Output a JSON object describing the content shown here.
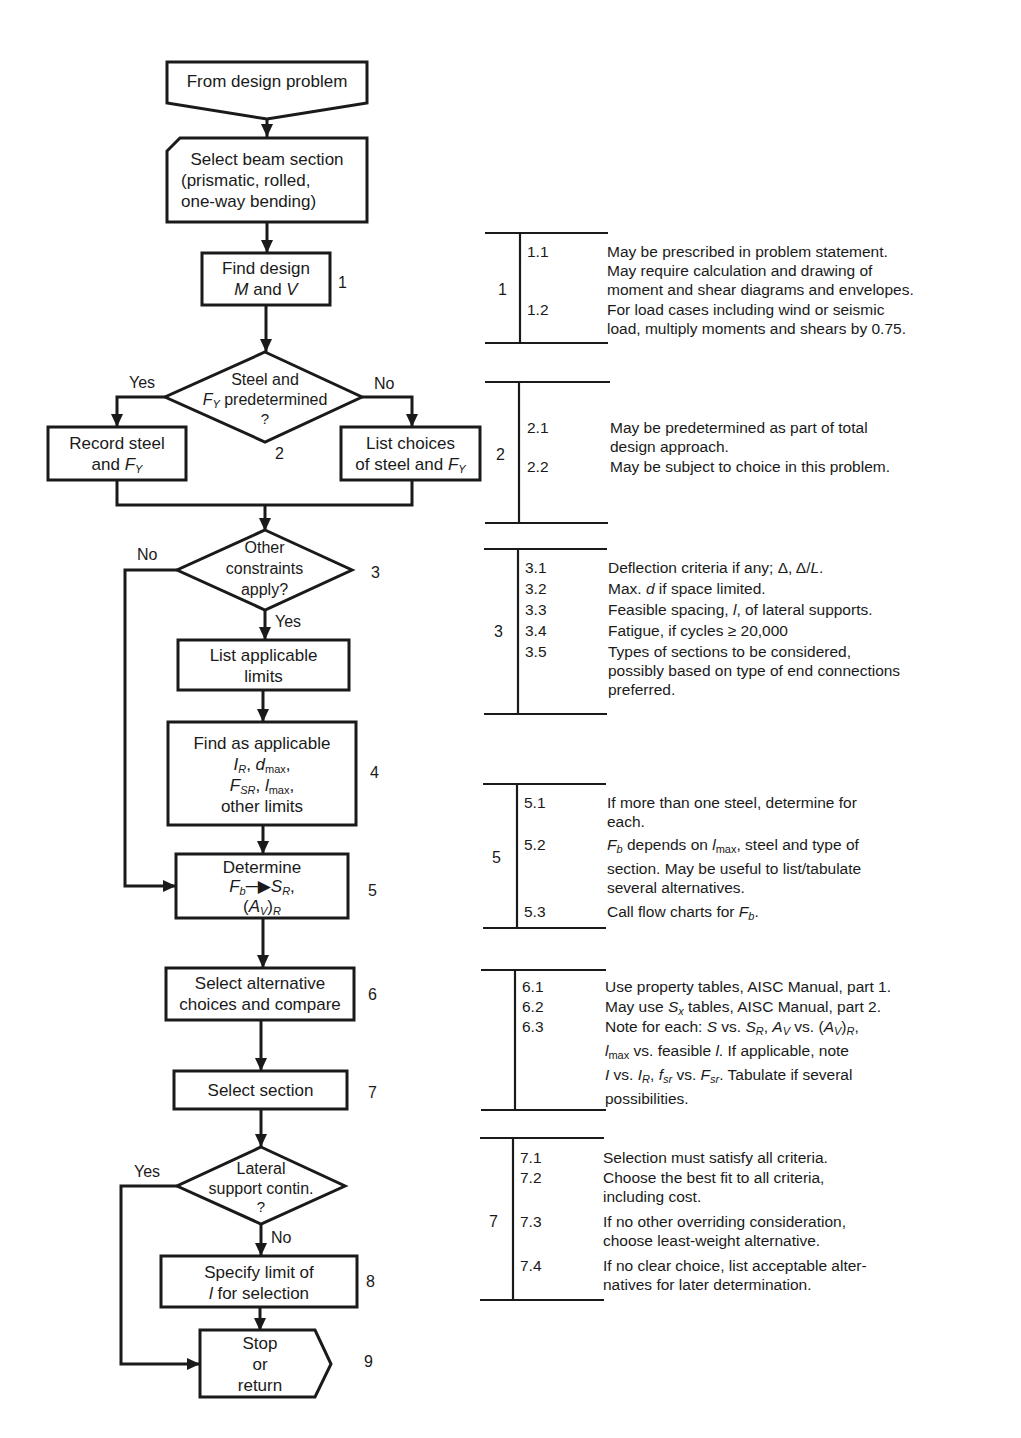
{
  "flowchart": {
    "start": {
      "label": "From design problem"
    },
    "select_beam": {
      "lines": [
        "Select beam section",
        "(prismatic, rolled,",
        "one-way bending)"
      ]
    },
    "find_design": {
      "lines": [
        "Find design",
        "M and V"
      ],
      "step": "1"
    },
    "decision_steel": {
      "lines": [
        "Steel and",
        "F_Y predetermined",
        "?"
      ],
      "step": "2",
      "yes": "Yes",
      "no": "No"
    },
    "record_steel": {
      "lines": [
        "Record steel",
        "and F_Y"
      ]
    },
    "list_choices": {
      "lines": [
        "List choices",
        "of steel and F_Y"
      ]
    },
    "decision_constraints": {
      "lines": [
        "Other",
        "constraints",
        "apply?"
      ],
      "step": "3",
      "yes": "Yes",
      "no": "No"
    },
    "list_limits": {
      "lines": [
        "List applicable",
        "limits"
      ]
    },
    "find_applicable": {
      "lines": [
        "Find as applicable",
        "I_R, d_max,",
        "F_SR, l_max,",
        "other limits"
      ],
      "step": "4"
    },
    "determine": {
      "lines": [
        "Determine",
        "F_b → S_R,",
        "(A_V)_R"
      ],
      "step": "5"
    },
    "select_alternative": {
      "lines": [
        "Select alternative",
        "choices and compare"
      ],
      "step": "6"
    },
    "select_section": {
      "label": "Select section",
      "step": "7"
    },
    "decision_lateral": {
      "lines": [
        "Lateral",
        "support contin.",
        "?"
      ],
      "yes": "Yes",
      "no": "No"
    },
    "specify_limit": {
      "lines": [
        "Specify limit of",
        "l for selection"
      ],
      "step": "8"
    },
    "stop": {
      "lines": [
        "Stop",
        "or",
        "return"
      ],
      "step": "9"
    }
  },
  "notes": [
    {
      "group": "1",
      "items": [
        {
          "id": "1.1",
          "text": "May be prescribed in problem statement.\nMay require calculation and drawing of\nmoment and shear diagrams and envelopes."
        },
        {
          "id": "1.2",
          "text": "For load cases including wind or seismic\nload, multiply moments and shears by 0.75."
        }
      ]
    },
    {
      "group": "2",
      "items": [
        {
          "id": "2.1",
          "text": "May be predetermined as part of total\ndesign approach."
        },
        {
          "id": "2.2",
          "text": "May be subject to choice in this problem."
        }
      ]
    },
    {
      "group": "3",
      "items": [
        {
          "id": "3.1",
          "text": "Deflection criteria if any; Δ, Δ/L."
        },
        {
          "id": "3.2",
          "text": "Max. d if space limited."
        },
        {
          "id": "3.3",
          "text": "Feasible spacing, l, of lateral supports."
        },
        {
          "id": "3.4",
          "text": "Fatigue, if cycles ≥ 20,000"
        },
        {
          "id": "3.5",
          "text": "Types of sections to be considered,\npossibly based on type of end connections\npreferred."
        }
      ]
    },
    {
      "group": "5",
      "items": [
        {
          "id": "5.1",
          "text": "If more than one steel, determine for\neach."
        },
        {
          "id": "5.2",
          "text": "F_b depends on l_max, steel and type of\nsection. May be useful to list/tabulate\nseveral alternatives."
        },
        {
          "id": "5.3",
          "text": "Call flow charts for F_b."
        }
      ]
    },
    {
      "group": "",
      "items": [
        {
          "id": "6.1",
          "text": "Use property tables, AISC Manual, part 1."
        },
        {
          "id": "6.2",
          "text": "May use S_x tables, AISC Manual, part 2."
        },
        {
          "id": "6.3",
          "text": "Note for each: S vs. S_R, A_V vs. (A_V)_R,\nl_max vs. feasible l. If applicable, note\nI vs. I_R, f_sr vs. F_sr. Tabulate if several\npossibilities."
        }
      ]
    },
    {
      "group": "7",
      "items": [
        {
          "id": "7.1",
          "text": "Selection must satisfy all criteria."
        },
        {
          "id": "7.2",
          "text": "Choose the best fit to all criteria,\nincluding cost."
        },
        {
          "id": "7.3",
          "text": "If no other overriding consideration,\nchoose least-weight alternative."
        },
        {
          "id": "7.4",
          "text": "If no clear choice, list acceptable alter-\nnatives for later determination."
        }
      ]
    }
  ]
}
